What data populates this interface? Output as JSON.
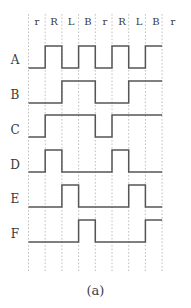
{
  "figure": {
    "caption": "(a)",
    "type": "timing-diagram",
    "line_color": "#555555",
    "grid_color": "#b9b9b9",
    "background": "#ffffff"
  },
  "chart_data": {
    "type": "line",
    "title": "",
    "subtitle": "",
    "xlabel": "",
    "ylabel": "",
    "grid": true,
    "legend": "none",
    "categories": [
      "r",
      "R",
      "L",
      "B",
      "r",
      "R",
      "L",
      "B"
    ],
    "tick_labels": [
      "r",
      "R",
      "L",
      "B",
      "r",
      "R",
      "L",
      "B",
      "r"
    ],
    "ylim": [
      0,
      1
    ],
    "series": [
      {
        "name": "A",
        "values": [
          0,
          1,
          0,
          1,
          0,
          1,
          0,
          1
        ]
      },
      {
        "name": "B",
        "values": [
          0,
          0,
          1,
          1,
          0,
          0,
          1,
          1
        ]
      },
      {
        "name": "C",
        "values": [
          0,
          1,
          1,
          1,
          0,
          1,
          1,
          1
        ]
      },
      {
        "name": "D",
        "values": [
          0,
          1,
          0,
          0,
          0,
          1,
          0,
          0
        ]
      },
      {
        "name": "E",
        "values": [
          0,
          0,
          1,
          0,
          0,
          0,
          1,
          0
        ]
      },
      {
        "name": "F",
        "values": [
          0,
          0,
          0,
          1,
          0,
          0,
          0,
          1
        ]
      }
    ]
  },
  "axis": {
    "column_labels": [
      {
        "id": "c0",
        "text": "r"
      },
      {
        "id": "c1",
        "text": "R"
      },
      {
        "id": "c2",
        "text": "L"
      },
      {
        "id": "c3",
        "text": "B"
      },
      {
        "id": "c4",
        "text": "r"
      },
      {
        "id": "c5",
        "text": "R"
      },
      {
        "id": "c6",
        "text": "L"
      },
      {
        "id": "c7",
        "text": "B"
      },
      {
        "id": "c8",
        "text": "r"
      }
    ],
    "row_labels": [
      {
        "id": "A",
        "text": "A"
      },
      {
        "id": "B",
        "text": "B"
      },
      {
        "id": "C",
        "text": "C"
      },
      {
        "id": "D",
        "text": "D"
      },
      {
        "id": "E",
        "text": "E"
      },
      {
        "id": "F",
        "text": "F"
      }
    ]
  }
}
